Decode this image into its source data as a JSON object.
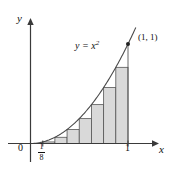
{
  "figure": {
    "background_color": "#ffffff",
    "axis_color": "#3a3a3a",
    "curve_color": "#4a4a4a",
    "rect_fill": "#d9d9d9",
    "rect_stroke": "#555555"
  },
  "labels": {
    "y_axis": "y",
    "x_axis": "x",
    "origin": "0",
    "x_tick_one": "1",
    "fraction_numerator": "1",
    "fraction_denominator": "8",
    "curve_equation_lhs": "y = x",
    "curve_equation_exponent": "2",
    "point_label": "(1, 1)"
  },
  "chart_data": {
    "type": "area",
    "title": "",
    "xlabel": "x",
    "ylabel": "y",
    "xlim": [
      0,
      1.15
    ],
    "ylim": [
      0,
      1.25
    ],
    "grid": false,
    "legend": "none",
    "curve": {
      "equation": "y = x^2",
      "label": "y = x²",
      "x": [
        0,
        0.125,
        0.25,
        0.375,
        0.5,
        0.625,
        0.75,
        0.875,
        1.0,
        1.08
      ],
      "y": [
        0,
        0.015625,
        0.0625,
        0.140625,
        0.25,
        0.390625,
        0.5625,
        0.765625,
        1.0,
        1.1664
      ]
    },
    "annotations": [
      {
        "text": "(1, 1)",
        "x": 1.0,
        "y": 1.0
      },
      {
        "text": "y = x²",
        "x": 0.6,
        "y": 0.92
      },
      {
        "text": "1/8",
        "x": 0.125,
        "y": 0
      },
      {
        "text": "1",
        "x": 1.0,
        "y": 0
      },
      {
        "text": "0",
        "x": 0,
        "y": 0
      }
    ],
    "rectangles": {
      "method": "left-endpoint inscribed rectangles",
      "n": 8,
      "width": 0.125,
      "x_left": [
        0,
        0.125,
        0.25,
        0.375,
        0.5,
        0.625,
        0.75,
        0.875
      ],
      "heights": [
        0,
        0.015625,
        0.0625,
        0.140625,
        0.25,
        0.390625,
        0.5625,
        0.765625
      ]
    },
    "x_ticks": [
      0,
      0.125,
      1.0
    ],
    "x_tick_labels": [
      "0",
      "1/8",
      "1"
    ]
  }
}
